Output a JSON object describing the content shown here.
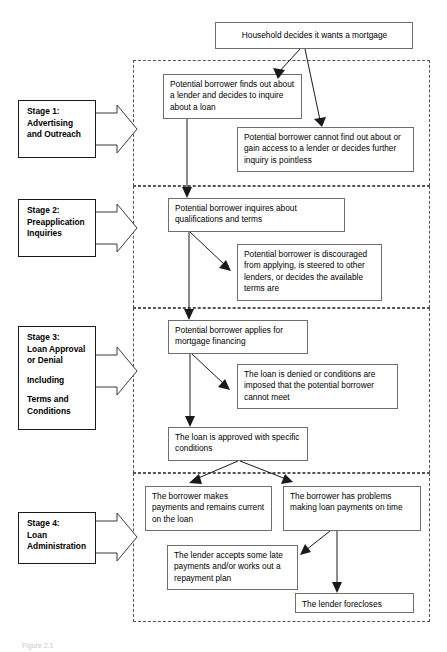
{
  "figure": {
    "caption": "Figure 2.1"
  },
  "start": {
    "label": "Household decides it wants a mortgage"
  },
  "stages": [
    {
      "id": "stage-1",
      "label_lines": [
        "Stage 1:",
        "Advertising",
        "and Outreach"
      ],
      "boxes": [
        {
          "id": "s1-proceed",
          "text": "Potential borrower finds out about a lender and decides to inquire about a loan"
        },
        {
          "id": "s1-exit",
          "text": "Potential borrower cannot find out about or gain access to a lender or decides further inquiry is pointless"
        }
      ]
    },
    {
      "id": "stage-2",
      "label_lines": [
        "Stage 2:",
        "Preapplication",
        "Inquiries"
      ],
      "boxes": [
        {
          "id": "s2-proceed",
          "text": "Potential borrower inquires about qualifications and terms"
        },
        {
          "id": "s2-exit",
          "text": "Potential borrower is discouraged from applying, is steered to other lenders, or decides the available terms are"
        }
      ]
    },
    {
      "id": "stage-3",
      "label_lines": [
        "Stage 3:",
        "Loan Approval",
        "or Denial",
        "",
        "Including",
        "",
        "Terms and",
        "Conditions"
      ],
      "boxes": [
        {
          "id": "s3-apply",
          "text": "Potential borrower applies for mortgage financing"
        },
        {
          "id": "s3-denied",
          "text": "The loan is denied or conditions are imposed that the potential borrower cannot meet"
        },
        {
          "id": "s3-approved",
          "text": "The loan is approved with specific conditions"
        }
      ]
    },
    {
      "id": "stage-4",
      "label_lines": [
        "Stage 4:",
        "Loan",
        "Administration"
      ],
      "boxes": [
        {
          "id": "s4-current",
          "text": "The borrower makes payments and remains current on the loan"
        },
        {
          "id": "s4-problems",
          "text": "The borrower has problems making loan payments on time"
        },
        {
          "id": "s4-workout",
          "text": "The lender accepts some late payments and/or works out a repayment plan"
        },
        {
          "id": "s4-foreclose",
          "text": "The lender forecloses"
        }
      ]
    }
  ]
}
